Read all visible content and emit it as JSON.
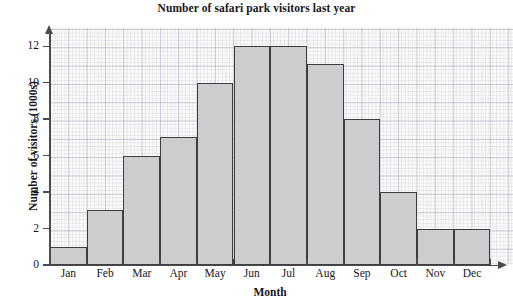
{
  "chart_data": {
    "type": "bar",
    "title": "Number of safari park visitors last year",
    "xlabel": "Month",
    "ylabel": "Number of visitors (1000s)",
    "categories": [
      "Jan",
      "Feb",
      "Mar",
      "Apr",
      "May",
      "Jun",
      "Jul",
      "Aug",
      "Sep",
      "Oct",
      "Nov",
      "Dec"
    ],
    "values": [
      1,
      3,
      6,
      7,
      10,
      12,
      12,
      11,
      8,
      4,
      2,
      2
    ],
    "ylim": [
      0,
      13
    ],
    "ytick_labels": [
      "0",
      "2",
      "4",
      "6",
      "8",
      "10",
      "12"
    ],
    "ytick_values": [
      0,
      2,
      4,
      6,
      8,
      10,
      12
    ],
    "grid": "graph-paper",
    "legend": "none",
    "bar_fill_color": "#cdcdcd",
    "bar_border_color": "#3e3e40",
    "axis_color": "#4a4a4c",
    "plot_background_color": "#fbfbfb",
    "page_background_color": "#ffffff"
  },
  "artifact": {
    "top_text": ""
  }
}
